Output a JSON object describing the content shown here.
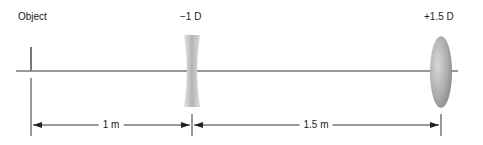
{
  "diagram": {
    "type": "optics-lens-system",
    "elements": [
      {
        "id": "object",
        "label": "Object",
        "x": 31
      },
      {
        "id": "lens1",
        "label": "−1 D",
        "kind": "concave (diverging) lens",
        "power": "-1 D",
        "x": 192
      },
      {
        "id": "lens2",
        "label": "+1.5 D",
        "kind": "convex (converging) lens",
        "power": "+1.5 D",
        "x": 441
      }
    ],
    "distances": [
      {
        "from": "object",
        "to": "lens1",
        "label": "1 m"
      },
      {
        "from": "lens1",
        "to": "lens2",
        "label": "1.5 m"
      }
    ],
    "colors": {
      "line": "#333333",
      "lens_dark": "#8a8a8a",
      "lens_light": "#e6e6e6"
    }
  }
}
